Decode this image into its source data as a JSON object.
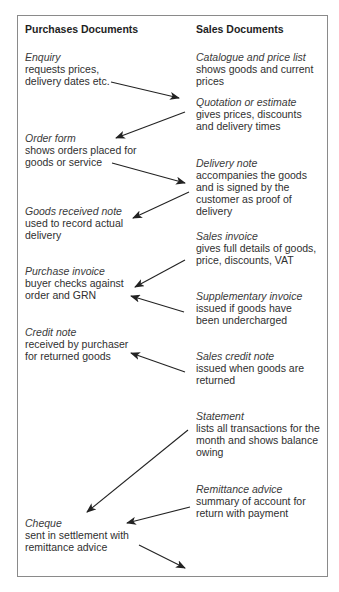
{
  "headers": {
    "purchases": "Purchases Documents",
    "sales": "Sales Documents"
  },
  "purchases": [
    {
      "id": "enquiry",
      "title": "Enquiry",
      "lines": [
        "requests prices,",
        "delivery dates etc."
      ]
    },
    {
      "id": "order-form",
      "title": "Order form",
      "lines": [
        "shows orders placed for",
        "goods or service"
      ]
    },
    {
      "id": "goods-received-note",
      "title": "Goods received note",
      "lines": [
        "used to record actual",
        "delivery"
      ]
    },
    {
      "id": "purchase-invoice",
      "title": "Purchase invoice",
      "lines": [
        "buyer checks against",
        "order and GRN"
      ]
    },
    {
      "id": "credit-note",
      "title": "Credit note",
      "lines": [
        "received by purchaser",
        "for returned goods"
      ]
    },
    {
      "id": "cheque",
      "title": "Cheque",
      "lines": [
        "sent in settlement with",
        "remittance advice"
      ]
    }
  ],
  "sales": [
    {
      "id": "catalogue",
      "title": "Catalogue and price list",
      "lines": [
        "shows goods and current",
        "prices"
      ]
    },
    {
      "id": "quotation",
      "title": "Quotation or estimate",
      "lines": [
        "gives prices, discounts",
        "and delivery times"
      ]
    },
    {
      "id": "delivery-note",
      "title": "Delivery note",
      "lines": [
        "accompanies the goods",
        "and is signed by the",
        "customer as proof of",
        "delivery"
      ]
    },
    {
      "id": "sales-invoice",
      "title": "Sales invoice",
      "lines": [
        "gives full details of goods,",
        "price, discounts, VAT"
      ]
    },
    {
      "id": "supplementary-invoice",
      "title": "Supplementary invoice",
      "lines": [
        "issued if goods have",
        "been undercharged"
      ]
    },
    {
      "id": "sales-credit-note",
      "title": "Sales credit note",
      "lines": [
        "issued when goods are",
        "returned"
      ]
    },
    {
      "id": "statement",
      "title": "Statement",
      "lines": [
        "lists all transactions for the",
        "month and shows balance",
        "owing"
      ]
    },
    {
      "id": "remittance-advice",
      "title": "Remittance advice",
      "lines": [
        "summary of account for",
        "return with payment"
      ]
    }
  ],
  "arrows": [
    {
      "from": "enquiry",
      "to": "quotation",
      "x1": 111,
      "y1": 82,
      "x2": 179,
      "y2": 98
    },
    {
      "from": "quotation",
      "to": "order-form",
      "x1": 185,
      "y1": 112,
      "x2": 116,
      "y2": 138
    },
    {
      "from": "order-form",
      "to": "delivery-note",
      "x1": 112,
      "y1": 163,
      "x2": 185,
      "y2": 183
    },
    {
      "from": "delivery-note",
      "to": "goods-received-note",
      "x1": 189,
      "y1": 192,
      "x2": 133,
      "y2": 218
    },
    {
      "from": "sales-invoice",
      "to": "purchase-invoice",
      "x1": 185,
      "y1": 260,
      "x2": 135,
      "y2": 287
    },
    {
      "from": "supplementary-invoice",
      "to": "purchase-invoice",
      "x1": 184,
      "y1": 312,
      "x2": 131,
      "y2": 296
    },
    {
      "from": "sales-credit-note",
      "to": "credit-note",
      "x1": 185,
      "y1": 372,
      "x2": 131,
      "y2": 353
    },
    {
      "from": "statement",
      "to": "cheque",
      "x1": 188,
      "y1": 430,
      "x2": 87,
      "y2": 512
    },
    {
      "from": "remittance-advice",
      "to": "cheque",
      "x1": 190,
      "y1": 507,
      "x2": 127,
      "y2": 523
    },
    {
      "from": "cheque",
      "to": "sales",
      "x1": 139,
      "y1": 545,
      "x2": 185,
      "y2": 568
    }
  ],
  "colors": {
    "border": "#8a8a8a",
    "text": "#2f2f2f",
    "arrow": "#222222",
    "background": "#ffffff"
  }
}
